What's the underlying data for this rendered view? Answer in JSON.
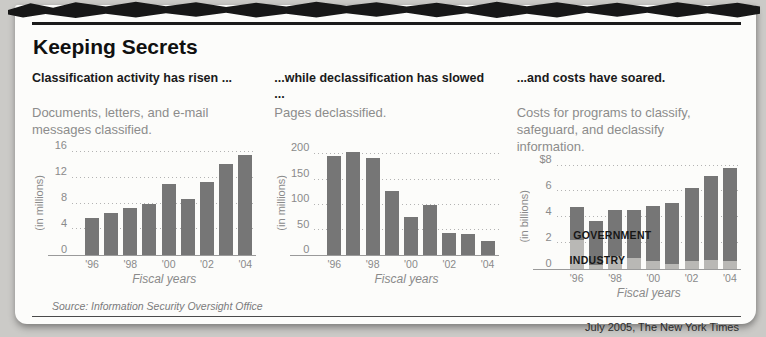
{
  "page": {
    "title": "Keeping Secrets",
    "source": "Source: Information Security Oversight Office",
    "credit": "July 2005, The New York Times"
  },
  "colors": {
    "bar_dark": "#767676",
    "bar_light": "#b9b8b5",
    "rule_black": "#1a1a1a",
    "background_paper": "#fcfcfa",
    "background_scan": "#cbcac7"
  },
  "chart_data": [
    {
      "type": "bar",
      "heading": "Classification activity has risen ...",
      "subtitle": "Documents, letters, and e-mail messages classified.",
      "categories": [
        "1996",
        "1997",
        "1998",
        "1999",
        "2000",
        "2001",
        "2002",
        "2003",
        "2004"
      ],
      "xtick_labels": [
        "'96",
        "",
        "'98",
        "",
        "'00",
        "",
        "'02",
        "",
        "'04"
      ],
      "values": [
        5.8,
        6.5,
        7.3,
        8.0,
        11.1,
        8.7,
        11.3,
        14.2,
        15.6
      ],
      "bar_color": "#767676",
      "ylabel": "(in millions)",
      "xlabel": "Fiscal years",
      "yticks": [
        0,
        4,
        8,
        12,
        16
      ],
      "ytick_labels": [
        "0",
        "4",
        "8",
        "12",
        "16"
      ],
      "ylim": [
        0,
        16
      ],
      "grid": true,
      "legend": null
    },
    {
      "type": "bar",
      "heading": "...while declassification has slowed ...",
      "subtitle": "Pages declassified.",
      "categories": [
        "1996",
        "1997",
        "1998",
        "1999",
        "2000",
        "2001",
        "2002",
        "2003",
        "2004"
      ],
      "xtick_labels": [
        "'96",
        "",
        "'98",
        "",
        "'00",
        "",
        "'02",
        "",
        "'04"
      ],
      "values": [
        196,
        204,
        193,
        127,
        75,
        100,
        44,
        43,
        28
      ],
      "bar_color": "#767676",
      "ylabel": "(in millions)",
      "xlabel": "Fiscal years",
      "yticks": [
        0,
        50,
        100,
        150,
        200
      ],
      "ytick_labels": [
        "0",
        "50",
        "100",
        "150",
        "200"
      ],
      "ylim": [
        0,
        200
      ],
      "grid": true,
      "legend": null
    },
    {
      "type": "stacked-bar",
      "heading": "...and costs have soared.",
      "subtitle": "Costs for programs to classify, safeguard, and declassify information.",
      "categories": [
        "1996",
        "1997",
        "1998",
        "1999",
        "2000",
        "2001",
        "2002",
        "2003",
        "2004"
      ],
      "xtick_labels": [
        "'96",
        "",
        "'98",
        "",
        "'00",
        "",
        "'02",
        "",
        "'04"
      ],
      "series": [
        {
          "name": "INDUSTRY",
          "color": "#b9b8b5",
          "values": [
            2.2,
            0.3,
            1.0,
            0.8,
            0.6,
            0.4,
            0.6,
            0.7,
            0.6
          ]
        },
        {
          "name": "GOVERNMENT",
          "color": "#767676",
          "values": [
            2.6,
            3.4,
            3.6,
            3.8,
            4.3,
            4.7,
            5.7,
            6.5,
            7.2
          ]
        }
      ],
      "ylabel": "(in billions)",
      "xlabel": "Fiscal years",
      "yticks": [
        0,
        2,
        4,
        6,
        8
      ],
      "ytick_labels": [
        "0",
        "2",
        "4",
        "6",
        "$8"
      ],
      "ylim": [
        0,
        8
      ],
      "grid": true,
      "annotations": [
        {
          "text": "GOVERNMENT"
        },
        {
          "text": "INDUSTRY"
        }
      ]
    }
  ]
}
